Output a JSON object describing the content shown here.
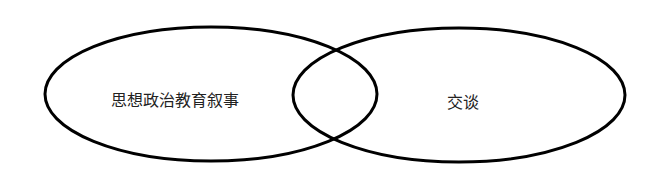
{
  "diagram": {
    "type": "venn",
    "stroke_color": "#000000",
    "background": "#ffffff",
    "sets": [
      {
        "id": "left",
        "label": "思想政治教育叙事"
      },
      {
        "id": "right",
        "label": "交谈"
      }
    ],
    "intersection_label": ""
  }
}
